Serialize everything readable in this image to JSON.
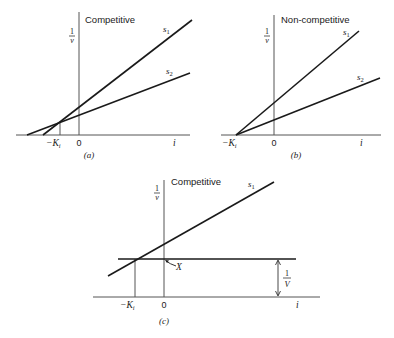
{
  "panels": {
    "a": {
      "caption": "(a)",
      "title": "Competitive",
      "y_label_num": "1",
      "y_label_den": "v",
      "x_label": "i",
      "origin_label": "0",
      "ki_label": "−K",
      "ki_sub": "i",
      "series": [
        {
          "name": "s",
          "sub": "1"
        },
        {
          "name": "s",
          "sub": "2"
        }
      ]
    },
    "b": {
      "caption": "(b)",
      "title": "Non-competitive",
      "y_label_num": "1",
      "y_label_den": "v",
      "x_label": "i",
      "origin_label": "0",
      "ki_label": "−K",
      "ki_sub": "i",
      "series": [
        {
          "name": "s",
          "sub": "1"
        },
        {
          "name": "s",
          "sub": "2"
        }
      ]
    },
    "c": {
      "caption": "(c)",
      "title": "Competitive",
      "y_label_num": "1",
      "y_label_den": "v",
      "x_label": "i",
      "origin_label": "0",
      "ki_label": "−K",
      "ki_sub": "i",
      "point_label": "X",
      "vmax_num": "1",
      "vmax_den": "V",
      "series": [
        {
          "name": "s",
          "sub": "1"
        }
      ]
    }
  },
  "colors": {
    "line": "#1a1a1a",
    "thin": "#555555",
    "text": "#1a1a1a"
  }
}
